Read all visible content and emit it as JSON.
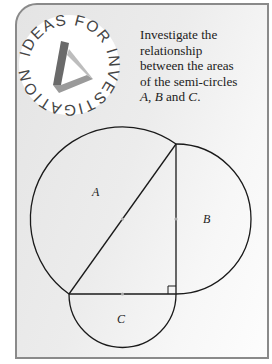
{
  "badge": {
    "text": "IDEAS FOR INVESTIGATION",
    "icon": "impossible-triangle-icon"
  },
  "prompt": {
    "line1": "Investigate the",
    "line2": "relationship",
    "line3": "between the areas",
    "line4": "of the semi-circles",
    "label_a": "A",
    "sep1": ", ",
    "label_b": "B",
    "and": " and ",
    "label_c": "C",
    "end": "."
  },
  "diagram": {
    "semicircle_labels": {
      "a": "A",
      "b": "B",
      "c": "C"
    },
    "has_right_angle": true
  }
}
